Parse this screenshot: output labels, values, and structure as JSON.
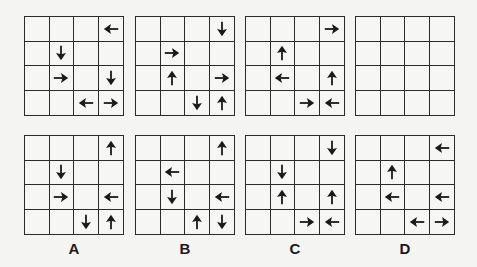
{
  "sequence": [
    {
      "id": "seq-1",
      "arrows": [
        [
          null,
          null,
          null,
          "left"
        ],
        [
          null,
          "down",
          null,
          null
        ],
        [
          null,
          "right",
          null,
          "down"
        ],
        [
          null,
          null,
          "left",
          "right"
        ]
      ]
    },
    {
      "id": "seq-2",
      "arrows": [
        [
          null,
          null,
          null,
          "down"
        ],
        [
          null,
          "right",
          null,
          null
        ],
        [
          null,
          "up",
          null,
          "right"
        ],
        [
          null,
          null,
          "down",
          "up"
        ]
      ]
    },
    {
      "id": "seq-3",
      "arrows": [
        [
          null,
          null,
          null,
          "right"
        ],
        [
          null,
          "up",
          null,
          null
        ],
        [
          null,
          "left",
          null,
          "up"
        ],
        [
          null,
          null,
          "right",
          "left"
        ]
      ]
    },
    {
      "id": "seq-4-question",
      "arrows": [
        [
          null,
          null,
          null,
          null
        ],
        [
          null,
          null,
          null,
          null
        ],
        [
          null,
          null,
          null,
          null
        ],
        [
          null,
          null,
          null,
          null
        ]
      ]
    }
  ],
  "options": [
    {
      "label": "A",
      "arrows": [
        [
          null,
          null,
          null,
          "up"
        ],
        [
          null,
          "down",
          null,
          null
        ],
        [
          null,
          "right",
          null,
          "left"
        ],
        [
          null,
          null,
          "down",
          "up"
        ]
      ]
    },
    {
      "label": "B",
      "arrows": [
        [
          null,
          null,
          null,
          "up"
        ],
        [
          null,
          "left",
          null,
          null
        ],
        [
          null,
          "down",
          null,
          "left"
        ],
        [
          null,
          null,
          "up",
          "down"
        ]
      ]
    },
    {
      "label": "C",
      "arrows": [
        [
          null,
          null,
          null,
          "down"
        ],
        [
          null,
          "down",
          null,
          null
        ],
        [
          null,
          "up",
          null,
          "up"
        ],
        [
          null,
          null,
          "right",
          "left"
        ]
      ]
    },
    {
      "label": "D",
      "arrows": [
        [
          null,
          null,
          null,
          "left"
        ],
        [
          null,
          "up",
          null,
          null
        ],
        [
          null,
          "left",
          null,
          "left"
        ],
        [
          null,
          null,
          "left",
          "right"
        ]
      ]
    }
  ],
  "layout": {
    "grid_x": [
      24,
      135,
      245,
      355
    ],
    "top_y": 16,
    "bottom_y": 135
  },
  "colors": {
    "line": "#2b2b2b",
    "arrow": "#1a1a1a",
    "background": "#f4f4f2"
  }
}
